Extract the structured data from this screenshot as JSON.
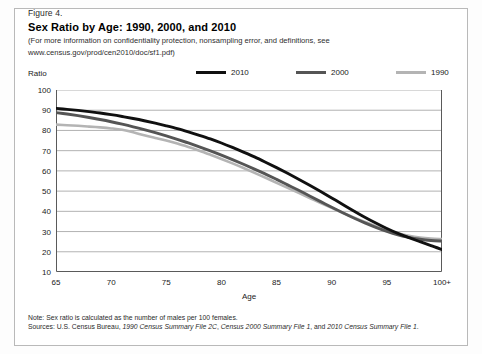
{
  "figure": {
    "number": "Figure 4.",
    "title": "Sex Ratio by Age: 1990, 2000, and 2010",
    "subtitle_line1": "(For more information on confidentiality protection, nonsampling error, and definitions, see",
    "subtitle_line2": "www.census.gov/prod/cen2010/doc/sf1.pdf)"
  },
  "axis": {
    "y_label": "Ratio",
    "x_label": "Age"
  },
  "legend": {
    "position": "top",
    "entries": [
      {
        "label": "2010",
        "color": "#101010",
        "icon": "line-swatch-icon"
      },
      {
        "label": "2000",
        "color": "#555555",
        "icon": "line-swatch-icon"
      },
      {
        "label": "1990",
        "color": "#b4b4b4",
        "icon": "line-swatch-icon"
      }
    ]
  },
  "notes": {
    "note": "Note: Sex ratio is calculated as the number of males per 100 females.",
    "sources_prefix": "Sources: U.S. Census Bureau, ",
    "source_1": "1990 Census Summary File 2C",
    "sources_sep1": ", ",
    "source_2": "Census 2000 Summary File 1",
    "sources_sep2": ", and ",
    "source_3": "2010 Census Summary File 1",
    "sources_end": "."
  },
  "chart_data": {
    "type": "line",
    "title": "Sex Ratio by Age: 1990, 2000, and 2010",
    "xlabel": "Age",
    "ylabel": "Ratio",
    "xlim": [
      65,
      100
    ],
    "ylim": [
      10,
      100
    ],
    "ytick_labels": [
      "100",
      "90",
      "80",
      "70",
      "60",
      "50",
      "40",
      "30",
      "20",
      "10"
    ],
    "ytick_values": [
      100,
      90,
      80,
      70,
      60,
      50,
      40,
      30,
      20,
      10
    ],
    "xtick_labels": [
      "65",
      "70",
      "75",
      "80",
      "85",
      "90",
      "95",
      "100+"
    ],
    "xtick_values": [
      65,
      70,
      75,
      80,
      85,
      90,
      95,
      100
    ],
    "grid": "horizontal",
    "x": [
      65,
      66,
      67,
      68,
      69,
      70,
      71,
      72,
      73,
      74,
      75,
      76,
      77,
      78,
      79,
      80,
      81,
      82,
      83,
      84,
      85,
      86,
      87,
      88,
      89,
      90,
      91,
      92,
      93,
      94,
      95,
      96,
      97,
      98,
      99,
      100
    ],
    "series": [
      {
        "name": "2010",
        "color": "#101010",
        "values": [
          90.9,
          90.4,
          89.9,
          89.3,
          88.6,
          87.8,
          86.9,
          85.9,
          84.8,
          83.6,
          82.3,
          80.9,
          79.3,
          77.6,
          75.8,
          73.8,
          71.6,
          69.3,
          66.9,
          64.3,
          61.6,
          58.8,
          55.9,
          52.9,
          49.8,
          46.6,
          43.4,
          40.2,
          37.1,
          34.2,
          31.5,
          29.1,
          27.0,
          25.0,
          23.0,
          21.1
        ]
      },
      {
        "name": "2000",
        "color": "#555555",
        "values": [
          88.8,
          88.1,
          87.3,
          86.4,
          85.4,
          84.3,
          83.1,
          81.8,
          80.4,
          78.9,
          77.3,
          75.6,
          73.8,
          71.9,
          69.9,
          67.8,
          65.6,
          63.3,
          60.9,
          58.4,
          55.8,
          53.1,
          50.4,
          47.6,
          44.8,
          42.0,
          39.3,
          36.7,
          34.3,
          32.1,
          30.1,
          28.4,
          27.1,
          26.2,
          25.6,
          25.3
        ]
      },
      {
        "name": "1990",
        "color": "#b4b4b4",
        "values": [
          82.9,
          82.6,
          82.3,
          81.9,
          81.5,
          81.0,
          80.3,
          79.1,
          77.6,
          76.3,
          75.0,
          73.5,
          71.8,
          70.0,
          68.0,
          65.9,
          63.7,
          61.4,
          59.0,
          56.6,
          54.1,
          51.6,
          49.1,
          46.6,
          44.1,
          41.7,
          39.3,
          37.0,
          34.8,
          32.7,
          30.8,
          29.2,
          27.9,
          27.0,
          26.5,
          26.3
        ]
      }
    ]
  }
}
